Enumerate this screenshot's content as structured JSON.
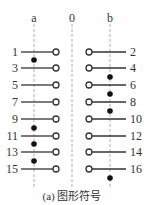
{
  "columns": [
    {
      "label": "a",
      "x": 34
    },
    {
      "label": "0",
      "x": 72
    },
    {
      "label": "b",
      "x": 110
    }
  ],
  "left_terminals": [
    {
      "label": "1",
      "y": 52
    },
    {
      "label": "3",
      "y": 68
    },
    {
      "label": "5",
      "y": 85
    },
    {
      "label": "7",
      "y": 102
    },
    {
      "label": "9",
      "y": 119
    },
    {
      "label": "11",
      "y": 136
    },
    {
      "label": "13",
      "y": 152
    },
    {
      "label": "15",
      "y": 169
    }
  ],
  "right_terminals": [
    {
      "label": "2",
      "y": 52
    },
    {
      "label": "4",
      "y": 68
    },
    {
      "label": "6",
      "y": 85
    },
    {
      "label": "8",
      "y": 102
    },
    {
      "label": "10",
      "y": 119
    },
    {
      "label": "12",
      "y": 136
    },
    {
      "label": "14",
      "y": 152
    },
    {
      "label": "16",
      "y": 169
    }
  ],
  "left_dots_y": [
    60,
    128,
    144,
    161
  ],
  "right_dots_y": [
    77,
    94,
    111,
    178
  ],
  "caption": "(a) 图形符号",
  "colors": {
    "line": "#333333",
    "dash": "#999999",
    "dot": "#111111"
  }
}
